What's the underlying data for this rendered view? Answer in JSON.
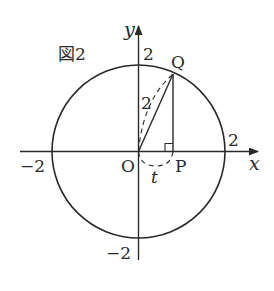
{
  "figure": {
    "title": "図2",
    "axes": {
      "x_label": "x",
      "y_label": "y",
      "x_ticks": {
        "neg": "−2",
        "pos": "2"
      },
      "y_ticks": {
        "neg": "−2",
        "pos": "2"
      }
    },
    "points": {
      "origin": "O",
      "P": "P",
      "Q": "Q"
    },
    "segment_label_OQ": "2",
    "arc_label": "t",
    "colors": {
      "stroke": "#2a2a2a",
      "background": "#ffffff"
    }
  }
}
